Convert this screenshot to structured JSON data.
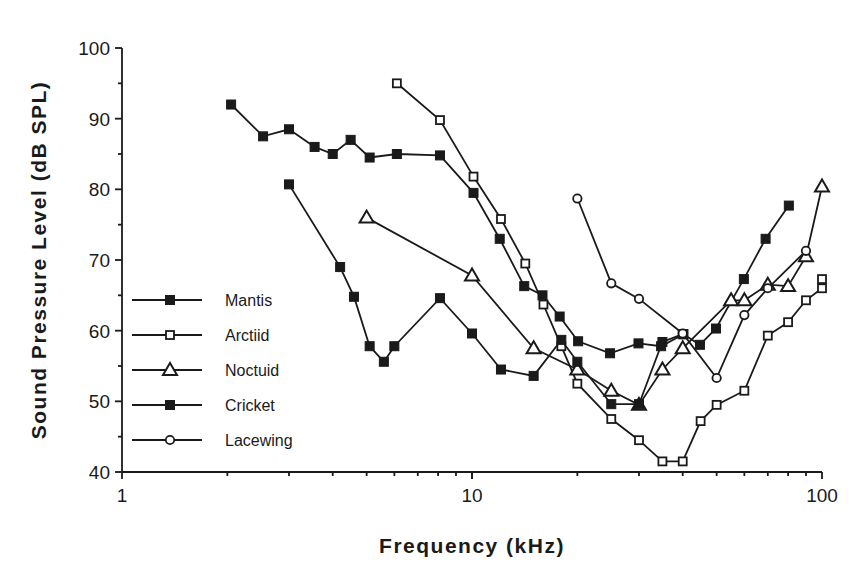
{
  "chart_data": {
    "type": "line",
    "title": "",
    "xlabel": "Frequency  (kHz)",
    "ylabel": "Sound  Pressure  Level  (dB  SPL)",
    "xscale": "log",
    "xlim": [
      1,
      100
    ],
    "ylim": [
      40,
      100
    ],
    "x_ticks": [
      1,
      10,
      100
    ],
    "x_tick_labels": [
      "1",
      "10",
      "100"
    ],
    "y_ticks": [
      40,
      50,
      60,
      70,
      80,
      90,
      100
    ],
    "y_tick_labels": [
      "40",
      "50",
      "60",
      "70",
      "80",
      "90",
      "100"
    ],
    "grid": false,
    "legend_position": "lower-left inside",
    "series": [
      {
        "name": "Mantis",
        "marker": "filled-square",
        "x": [
          2.05,
          2.53,
          3.0,
          3.55,
          4.0,
          4.5,
          5.1,
          6.1,
          8.1,
          10.1,
          12.0,
          14.1,
          15.9,
          17.8,
          20.1,
          24.8,
          29.9,
          34.7,
          40.2,
          44.8,
          49.8,
          59.8,
          69.0,
          80.4
        ],
        "y": [
          92.0,
          87.5,
          88.5,
          86.0,
          85.0,
          87.0,
          84.5,
          85.0,
          84.8,
          79.5,
          73.0,
          66.3,
          65.0,
          62.0,
          58.5,
          56.8,
          58.2,
          57.8,
          59.5,
          58.0,
          60.3,
          67.3,
          73.0,
          77.7
        ]
      },
      {
        "name": "Arctiid",
        "marker": "open-square",
        "x": [
          6.1,
          8.1,
          10.1,
          12.1,
          14.2,
          16.0,
          18.0,
          20.0,
          25.0,
          30.0,
          35.0,
          40.0,
          45.0,
          50.0,
          60.0,
          70.0,
          80.0,
          90.0,
          100.0,
          100.0
        ],
        "y": [
          95.0,
          89.8,
          81.8,
          75.8,
          69.5,
          63.7,
          57.8,
          52.5,
          47.5,
          44.5,
          41.5,
          41.5,
          47.2,
          49.5,
          51.5,
          59.3,
          61.2,
          64.3,
          66.0,
          67.3
        ]
      },
      {
        "name": "Noctuid",
        "marker": "open-triangle",
        "x": [
          5.0,
          10.0,
          15.0,
          20.0,
          25.0,
          30.0,
          35.0,
          40.0,
          55.0,
          60.0,
          70.0,
          80.0,
          90.0,
          100.0
        ],
        "y": [
          76.0,
          67.8,
          57.5,
          54.5,
          51.5,
          49.5,
          54.5,
          57.5,
          64.3,
          64.3,
          66.5,
          66.3,
          70.5,
          80.4
        ]
      },
      {
        "name": "Cricket",
        "marker": "filled-square",
        "x": [
          3.0,
          4.2,
          4.6,
          5.1,
          5.6,
          6.0,
          8.1,
          10.0,
          12.1,
          15.0,
          18.0,
          20.0,
          25.0,
          30.0,
          35.0,
          40.0
        ],
        "y": [
          80.7,
          69.0,
          64.8,
          57.8,
          55.6,
          57.8,
          64.6,
          59.6,
          54.5,
          53.6,
          58.7,
          55.6,
          49.6,
          49.6,
          58.4,
          59.5
        ]
      },
      {
        "name": "Lacewing",
        "marker": "open-circle",
        "x": [
          20.0,
          25.0,
          30.0,
          40.0,
          50.0,
          60.0,
          70.0,
          90.0
        ],
        "y": [
          78.7,
          66.7,
          64.5,
          59.6,
          53.3,
          62.2,
          66.0,
          71.3
        ]
      }
    ]
  },
  "legend": {
    "items": [
      {
        "label": "Mantis",
        "marker": "filled-square"
      },
      {
        "label": "Arctiid",
        "marker": "open-square"
      },
      {
        "label": "Noctuid",
        "marker": "open-triangle"
      },
      {
        "label": "Cricket",
        "marker": "filled-square"
      },
      {
        "label": "Lacewing",
        "marker": "open-circle"
      }
    ]
  },
  "colors": {
    "ink": "#1a1a1a",
    "background": "#ffffff"
  }
}
